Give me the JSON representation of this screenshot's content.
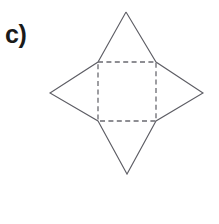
{
  "figure": {
    "label": "c)",
    "kind": "geometry-net",
    "canvas": {
      "width": 219,
      "height": 224,
      "background": "#ffffff"
    },
    "colors": {
      "solid_stroke": "#5d5d64",
      "dashed_stroke": "#6a6a70",
      "label_text": "#1a1a1a",
      "face_fill": "#ffffff"
    },
    "base_square": {
      "name": "dashed-square-base",
      "style": "dashed",
      "corners": {
        "top_left": [
          98,
          62
        ],
        "top_right": [
          156,
          62
        ],
        "bottom_right": [
          156,
          121
        ],
        "bottom_left": [
          98,
          121
        ]
      },
      "points": "98,62 156,62 156,121 98,121",
      "width": 58,
      "height": 59
    },
    "apexes": {
      "top": [
        126,
        12
      ],
      "right": [
        203,
        93
      ],
      "bottom": [
        127,
        174
      ],
      "left": [
        50,
        93
      ]
    },
    "triangles": [
      {
        "name": "triangle-top",
        "points": "98,62 156,62 126,12"
      },
      {
        "name": "triangle-right",
        "points": "156,62 156,121 203,93"
      },
      {
        "name": "triangle-bottom",
        "points": "98,121 156,121 127,174"
      },
      {
        "name": "triangle-left",
        "points": "98,62 98,121 50,93"
      }
    ],
    "solid_outline": "126,12 156,62 203,93 156,121 127,174 98,121 50,93 98,62 126,12"
  }
}
